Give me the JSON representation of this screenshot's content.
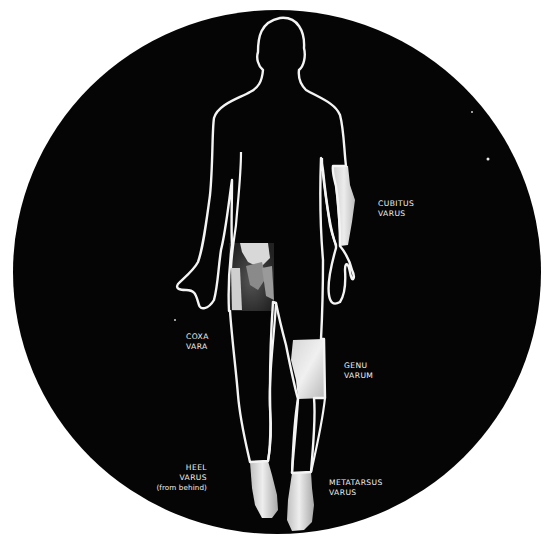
{
  "figure": {
    "background_color": "#ffffff",
    "disc_color": "#050505",
    "outline_color": "#f4f4f4",
    "photo_inset_color": "#e4e4e4"
  },
  "labels": {
    "cubitus_varus": {
      "line1": "CUBITUS",
      "line2": "VARUS"
    },
    "coxa_vara": {
      "line1": "COXA",
      "line2": "VARA"
    },
    "genu_varum": {
      "line1": "GENU",
      "line2": "VARUM"
    },
    "heel_varus": {
      "line1": "HEEL",
      "line2": "VARUS",
      "line3": "(from behind)"
    },
    "metatarsus_varus": {
      "line1": "METATARSUS",
      "line2": "VARUS"
    }
  },
  "insets": [
    {
      "name": "elbow-forearm-photo",
      "region": "right forearm"
    },
    {
      "name": "hip-xray",
      "region": "left hip"
    },
    {
      "name": "knee-photo",
      "region": "right knee"
    },
    {
      "name": "left-heel-photo",
      "region": "left heel"
    },
    {
      "name": "right-foot-photo",
      "region": "right foot"
    }
  ]
}
